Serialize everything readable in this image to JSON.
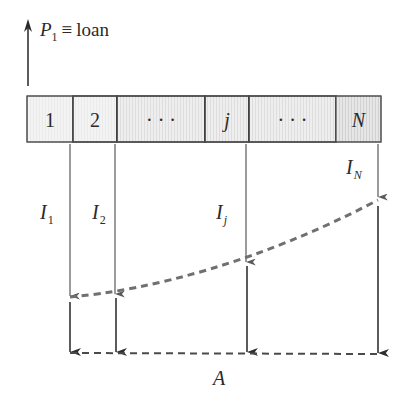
{
  "title": {
    "symbol": "P",
    "subscript": "1",
    "equiv": "≡",
    "word": "loan"
  },
  "periods": [
    {
      "label": "1",
      "italic": false,
      "x": 27,
      "w": 46,
      "shade": "light"
    },
    {
      "label": "2",
      "italic": false,
      "x": 73,
      "w": 44,
      "shade": "light"
    },
    {
      "label": "· · ·",
      "italic": false,
      "x": 117,
      "w": 88,
      "shade": "medium"
    },
    {
      "label": "j",
      "italic": true,
      "x": 205,
      "w": 44,
      "shade": "medium"
    },
    {
      "label": "· · ·",
      "italic": false,
      "x": 249,
      "w": 87,
      "shade": "medium"
    },
    {
      "label": "N",
      "italic": true,
      "x": 336,
      "w": 45,
      "shade": "dark"
    }
  ],
  "interest_labels": [
    {
      "symbol": "I",
      "subscript": "1",
      "x": 40,
      "y": 219
    },
    {
      "symbol": "I",
      "subscript": "2",
      "x": 92,
      "y": 219
    },
    {
      "symbol": "I",
      "subscript": "j",
      "x": 216,
      "y": 219
    },
    {
      "symbol": "I",
      "subscript": "N",
      "x": 346,
      "y": 174
    }
  ],
  "annuity_label": "A",
  "colors": {
    "line": "#555555",
    "dark_line": "#333333",
    "dash": "#6a6a6a",
    "cell_light": "#f1f1f1",
    "cell_medium": "#e6e6e6",
    "cell_dark": "#dcdcdc"
  }
}
